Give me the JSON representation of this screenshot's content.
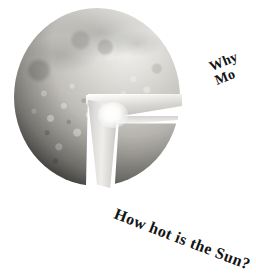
{
  "page": {
    "background_color": "#ffffff",
    "width": 256,
    "height": 274
  },
  "figure": {
    "name": "moon-cutaway",
    "surface_color": "#c3c1bc",
    "shadow_color": "#2a2926",
    "core_color": "#ffffff",
    "cut_face_color": "#dedddA"
  },
  "questions": {
    "moon": {
      "line1": "Why",
      "line2": "Mo",
      "note": "text runs off the right edge of the page",
      "rotation_deg": -22
    },
    "sun": {
      "text": "How hot is the Sun?",
      "rotation_deg": 21
    }
  }
}
